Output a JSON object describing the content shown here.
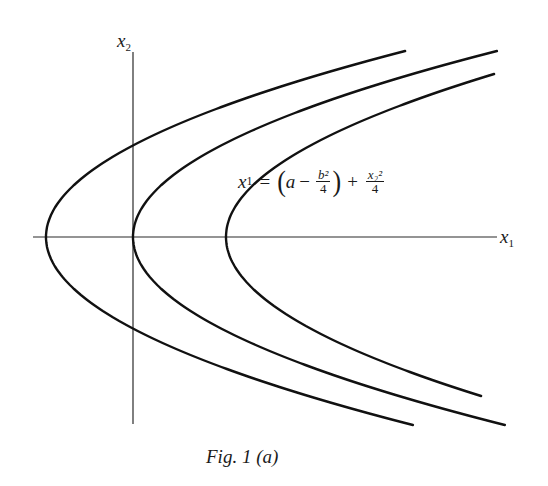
{
  "figure": {
    "caption": "Fig. 1 (a)",
    "x_axis_label": "x",
    "x_axis_sub": "1",
    "y_axis_label": "x",
    "y_axis_sub": "2",
    "equation": {
      "lhs_var": "x",
      "lhs_sub": "1",
      "equals": "=",
      "open_paren": "(",
      "a": "a",
      "minus": "−",
      "frac1_num": "b²",
      "frac1_den": "4",
      "close_paren": ")",
      "plus": "+",
      "frac2_num": "x₂²",
      "frac2_den": "4"
    }
  },
  "chart_data": {
    "type": "line",
    "title": "Fig. 1 (a)",
    "xlabel": "x1",
    "ylabel": "x2",
    "annotation": "x1 = (a - b^2/4) + x2^2/4",
    "axes": {
      "origin_px": [
        133,
        237
      ],
      "x_axis_px": [
        33,
        497
      ],
      "y_axis_px": [
        52,
        424
      ]
    },
    "series": [
      {
        "name": "curve-left",
        "vertex_px": [
          46,
          237
        ],
        "k": 0.01038,
        "y_range_px": [
          51,
          425
        ]
      },
      {
        "name": "curve-origin",
        "vertex_px": [
          133,
          237
        ],
        "k": 0.01052,
        "y_range_px": [
          51,
          425
        ]
      },
      {
        "name": "curve-right",
        "vertex_px": [
          226,
          237
        ],
        "k": 0.01009,
        "y_range_px": [
          74,
          397
        ]
      }
    ],
    "grid": false,
    "legend": null
  }
}
